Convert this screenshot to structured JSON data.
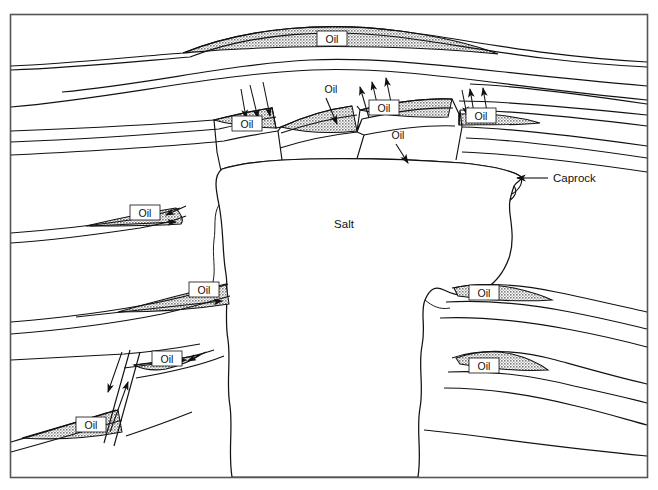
{
  "figure": {
    "title_visible": false,
    "background_color": "#ffffff",
    "line_color": "#111111",
    "shading_color": "#9a9a9a",
    "frame": {
      "x": 10,
      "y": 14,
      "width": 638,
      "height": 464,
      "stroke": "#555555"
    }
  },
  "labels": {
    "salt": "Salt",
    "caprock": "Caprock",
    "oil": "Oil"
  },
  "oil_accumulations": [
    {
      "id": "crest-anticline",
      "label": "Oil",
      "label_x": 332,
      "label_y": 41,
      "boxed": true,
      "region": "top arch crest"
    },
    {
      "id": "left-fault-block",
      "label": "Oil",
      "label_x": 247,
      "label_y": 126,
      "boxed": true,
      "region": "upper-left fault block"
    },
    {
      "id": "center-fault-crest",
      "label": "Oil",
      "label_x": 331,
      "label_y": 92,
      "boxed": false,
      "region": "center crest, arrow-pointed"
    },
    {
      "id": "center-right-block",
      "label": "Oil",
      "label_x": 384,
      "label_y": 110,
      "boxed": true,
      "region": "center-right fault block"
    },
    {
      "id": "right-fault-block",
      "label": "Oil",
      "label_x": 481,
      "label_y": 118,
      "boxed": true,
      "region": "upper-right fault block"
    },
    {
      "id": "sub-caprock",
      "label": "Oil",
      "label_x": 398,
      "label_y": 138,
      "boxed": false,
      "region": "below caprock, arrow-pointed"
    },
    {
      "id": "left-flank-upper",
      "label": "Oil",
      "label_x": 145,
      "label_y": 215,
      "boxed": true,
      "region": "left flank pinch-out upper"
    },
    {
      "id": "left-flank-middle",
      "label": "Oil",
      "label_x": 204,
      "label_y": 292,
      "boxed": true,
      "region": "left flank pinch-out middle"
    },
    {
      "id": "right-flank-upper",
      "label": "Oil",
      "label_x": 484,
      "label_y": 295,
      "boxed": true,
      "region": "right flank pinch-out upper"
    },
    {
      "id": "right-flank-lower",
      "label": "Oil",
      "label_x": 484,
      "label_y": 368,
      "boxed": true,
      "region": "right flank pinch-out lower"
    },
    {
      "id": "lower-left-hanging",
      "label": "Oil",
      "label_x": 167,
      "label_y": 361,
      "boxed": true,
      "region": "lower-left hanging wall"
    },
    {
      "id": "lower-left-footwall",
      "label": "Oil",
      "label_x": 91,
      "label_y": 427,
      "boxed": true,
      "region": "lower-left footwall"
    }
  ],
  "annotations": [
    {
      "id": "caprock-callout",
      "text": "Caprock",
      "text_x": 553,
      "text_y": 182,
      "leader_from": [
        548,
        178
      ],
      "leader_to": [
        517,
        178
      ],
      "arrow": true
    },
    {
      "id": "salt-body-label",
      "text": "Salt",
      "text_x": 344,
      "text_y": 228,
      "arrow": false
    }
  ],
  "structures": {
    "salt_dome": "central mushroom-shaped diapir piercing sedimentary layers",
    "caprock": "thin double-line layer capping the salt dome crest",
    "faults": [
      "upper-left normal fault set",
      "center normal fault",
      "center-right normal fault",
      "upper-right normal fault set",
      "lower-left normal fault"
    ],
    "strata_count": 9
  }
}
